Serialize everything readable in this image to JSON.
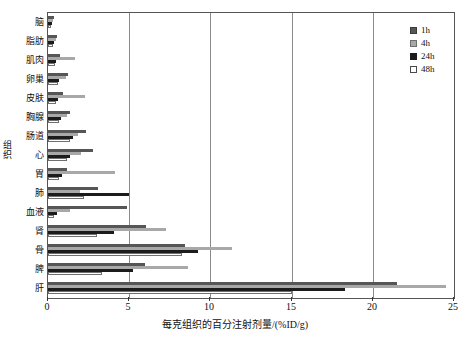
{
  "chart_data": {
    "type": "bar",
    "orientation": "horizontal",
    "title": "",
    "xlabel": "每克组织的百分注射剂量/(%ID/g)",
    "ylabel": "组织",
    "xlim": [
      0,
      25
    ],
    "xticks": [
      0,
      5,
      10,
      15,
      20,
      25
    ],
    "xtick_labels": [
      "0",
      "5",
      "10",
      "15",
      "20",
      "25"
    ],
    "grid": "vertical",
    "legend_position": "top-right",
    "categories": [
      "脑",
      "脂肪",
      "肌肉",
      "卵巢",
      "皮肤",
      "胸腺",
      "肠道",
      "心",
      "胃",
      "肺",
      "血液",
      "肾",
      "骨",
      "脾",
      "肝"
    ],
    "series": [
      {
        "name": "1h",
        "color": "#565656",
        "values": [
          0.35,
          0.55,
          0.75,
          1.25,
          0.95,
          1.35,
          2.35,
          2.75,
          1.15,
          3.05,
          4.85,
          6.05,
          8.45,
          5.95,
          21.5
        ]
      },
      {
        "name": "4h",
        "color": "#a8a8a8",
        "values": [
          0.3,
          0.5,
          1.65,
          1.1,
          2.25,
          1.2,
          1.85,
          2.05,
          4.15,
          1.95,
          1.35,
          7.25,
          11.35,
          8.65,
          24.5
        ]
      },
      {
        "name": "24h",
        "color": "#1c1c1c",
        "values": [
          0.25,
          0.35,
          0.5,
          0.7,
          0.6,
          0.8,
          1.55,
          1.35,
          0.85,
          5.0,
          0.55,
          4.05,
          9.25,
          5.25,
          18.3
        ]
      },
      {
        "name": "48h",
        "color": "#ffffff",
        "values": [
          0.2,
          0.3,
          0.45,
          0.6,
          0.5,
          0.65,
          1.35,
          1.15,
          0.7,
          2.2,
          0.4,
          3.0,
          8.25,
          3.3,
          15.0
        ]
      }
    ]
  },
  "legend": {
    "entries": [
      {
        "label": "1h"
      },
      {
        "label": "4h"
      },
      {
        "label": "24h"
      },
      {
        "label": "48h"
      }
    ]
  },
  "axis": {
    "y_title_chars": [
      "组",
      "织"
    ]
  }
}
